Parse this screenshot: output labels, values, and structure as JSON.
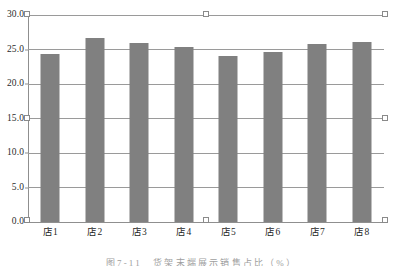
{
  "chart_data": {
    "type": "bar",
    "title": "",
    "xlabel": "",
    "ylabel": "",
    "categories": [
      "店1",
      "店2",
      "店3",
      "店4",
      "店5",
      "店6",
      "店7",
      "店8"
    ],
    "values": [
      24.4,
      26.7,
      25.9,
      25.4,
      24.1,
      24.7,
      25.8,
      26.1
    ],
    "ylim": [
      0.0,
      30.0
    ],
    "ytick_values": [
      0.0,
      5.0,
      10.0,
      15.0,
      20.0,
      25.0,
      30.0
    ],
    "ytick_labels": [
      "0.0",
      "5.0",
      "10.0",
      "15.0",
      "20.0",
      "25.0",
      "30.0"
    ],
    "grid": true,
    "legend": false,
    "legend_position": "none",
    "bar_color": "#808080",
    "gridline_color": "#9a9a9a",
    "axis_color": "#8f8f8f"
  },
  "caption": {
    "text": "图7-11　货架末端展示销售占比（%）"
  },
  "selection": {
    "handles": [
      "top-left",
      "top-center",
      "top-right",
      "middle-left",
      "middle-right",
      "bottom-left",
      "bottom-center",
      "bottom-right"
    ],
    "handle_fill": "#ffffff",
    "handle_border": "#8a8a8a"
  }
}
